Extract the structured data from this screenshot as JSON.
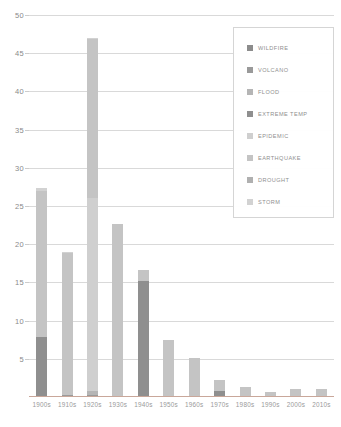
{
  "chart_data": {
    "type": "bar",
    "subtype": "stacked-bar",
    "title": "",
    "xlabel": "",
    "ylabel": "",
    "ylim": [
      0,
      50
    ],
    "ytick_step": 5,
    "yticks": [
      "50",
      "45",
      "40",
      "35",
      "30",
      "25",
      "20",
      "15",
      "10",
      "5"
    ],
    "grid": true,
    "legend_position": "upper-right",
    "categories": [
      "1900s",
      "1910s",
      "1920s",
      "1930s",
      "1940s",
      "1950s",
      "1960s",
      "1970s",
      "1980s",
      "1990s",
      "2000s",
      "2010s"
    ],
    "series": [
      {
        "name": "WILDFIRE",
        "color": "#8c8c8c",
        "values": [
          0,
          0,
          0,
          0,
          0,
          0,
          0,
          0,
          0,
          0,
          0,
          0
        ]
      },
      {
        "name": "VOLCANO",
        "color": "#9a9a9a",
        "values": [
          0,
          0.2,
          0.3,
          0,
          0,
          0,
          0,
          0,
          0,
          0,
          0,
          0
        ]
      },
      {
        "name": "FLOOD",
        "color": "#b5b5b5",
        "values": [
          0,
          0,
          0.5,
          0,
          0,
          0,
          0,
          0,
          0,
          0,
          0,
          0
        ]
      },
      {
        "name": "EXTREME TEMP",
        "color": "#8f8f8f",
        "values": [
          7.8,
          0,
          0,
          0,
          15.2,
          0,
          0,
          0.8,
          0,
          0,
          0,
          0
        ]
      },
      {
        "name": "EPIDEMIC",
        "color": "#cfcfcf",
        "values": [
          0,
          0,
          25.2,
          0,
          0,
          0,
          0,
          0,
          0,
          0,
          0,
          0
        ]
      },
      {
        "name": "EARTHQUAKE",
        "color": "#c4c4c4",
        "values": [
          19.2,
          18.6,
          20.8,
          22.6,
          1.4,
          7.5,
          5.1,
          1.4,
          1.3,
          0.7,
          1.1,
          1.0
        ]
      },
      {
        "name": "DROUGHT",
        "color": "#b0b0b0",
        "values": [
          0,
          0,
          0,
          0,
          0,
          0,
          0,
          0,
          0,
          0,
          0,
          0
        ]
      },
      {
        "name": "STORM",
        "color": "#d2d2d2",
        "values": [
          0.3,
          0.2,
          0.2,
          0,
          0,
          0,
          0,
          0,
          0,
          0,
          0,
          0
        ]
      }
    ],
    "totals": [
      27.3,
      19.0,
      47.0,
      22.6,
      16.6,
      7.5,
      5.1,
      2.2,
      1.3,
      0.7,
      1.1,
      1.0
    ]
  },
  "legend": {
    "items": [
      {
        "label": "WILDFIRE",
        "color": "#8c8c8c"
      },
      {
        "label": "VOLCANO",
        "color": "#9a9a9a"
      },
      {
        "label": "FLOOD",
        "color": "#b5b5b5"
      },
      {
        "label": "EXTREME TEMP",
        "color": "#8f8f8f"
      },
      {
        "label": "EPIDEMIC",
        "color": "#cfcfcf"
      },
      {
        "label": "EARTHQUAKE",
        "color": "#c4c4c4"
      },
      {
        "label": "DROUGHT",
        "color": "#b0b0b0"
      },
      {
        "label": "STORM",
        "color": "#d2d2d2"
      }
    ]
  },
  "axes": {
    "grid_color": "#d9d9d9",
    "baseline_color": "#c9a79a",
    "tick_label_color": "#8a8a8a"
  }
}
